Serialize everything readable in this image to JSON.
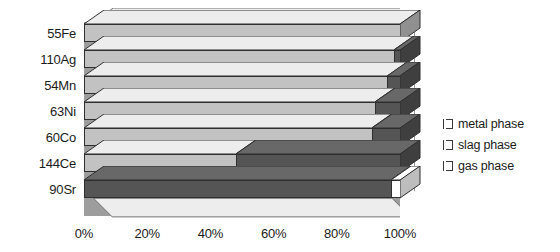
{
  "chart_data": {
    "type": "bar",
    "orientation": "horizontal",
    "stacked": true,
    "style": "3d",
    "title": "",
    "xlabel": "",
    "ylabel": "",
    "xlim": [
      0,
      100
    ],
    "xticks": [
      "0%",
      "20%",
      "40%",
      "60%",
      "80%",
      "100%"
    ],
    "xtick_values": [
      0,
      20,
      40,
      60,
      80,
      100
    ],
    "grid": false,
    "legend_position": "right",
    "categories": [
      "55Fe",
      "110Ag",
      "54Mn",
      "63Ni",
      "60Co",
      "144Ce",
      "90Sr"
    ],
    "series": [
      {
        "name": "metal phase",
        "color": "#c2c2c2",
        "values": [
          100,
          98,
          96,
          92,
          91,
          48,
          0
        ]
      },
      {
        "name": "slag phase",
        "color": "#555555",
        "values": [
          0,
          2,
          4,
          8,
          9,
          52,
          97
        ]
      },
      {
        "name": "gas phase",
        "color": "#ffffff",
        "values": [
          0,
          0,
          0,
          0,
          0,
          0,
          3
        ]
      }
    ]
  },
  "legend": {
    "items": [
      {
        "label": "metal phase",
        "color": "#c2c2c2"
      },
      {
        "label": "slag phase",
        "color": "#555555"
      },
      {
        "label": "gas phase",
        "color": "#ffffff"
      }
    ]
  },
  "axes": {
    "y_categories": [
      "55Fe",
      "110Ag",
      "54Mn",
      "63Ni",
      "60Co",
      "144Ce",
      "90Sr"
    ],
    "x_ticks": [
      "0%",
      "20%",
      "40%",
      "60%",
      "80%",
      "100%"
    ]
  },
  "colors": {
    "metal_phase": "#c2c2c2",
    "slag_phase": "#555555",
    "gas_phase": "#ffffff",
    "back_wall": "#9d9d9d",
    "floor": "#e9e9e9",
    "outline": "#2f2f2f",
    "text": "#1b1b1b"
  }
}
